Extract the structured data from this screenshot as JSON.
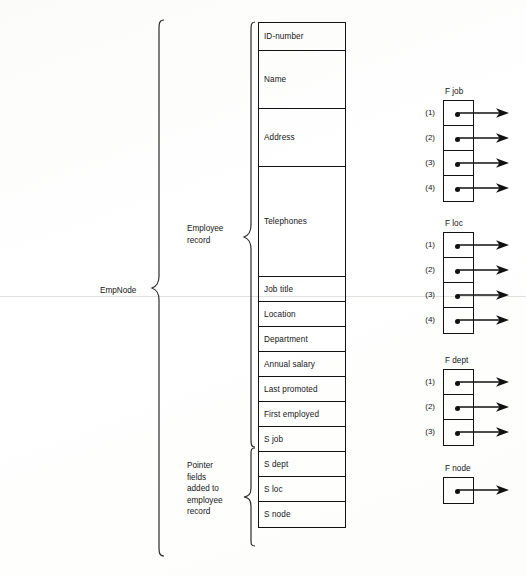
{
  "figure": {
    "node_label": "EmpNode",
    "group_labels": {
      "employee_record": "Employee\nrecord",
      "pointer_fields": "Pointer\nfields\nadded to\nemployee\nrecord"
    }
  },
  "record_fields": [
    {
      "label": "ID-number",
      "height": 28
    },
    {
      "label": "Name",
      "height": 58
    },
    {
      "label": "Address",
      "height": 58
    },
    {
      "label": "Telephones",
      "height": 110
    },
    {
      "label": "Job title",
      "height": 25
    },
    {
      "label": "Location",
      "height": 25
    },
    {
      "label": "Department",
      "height": 25
    },
    {
      "label": "Annual salary",
      "height": 25
    },
    {
      "label": "Last promoted",
      "height": 25
    },
    {
      "label": "First employed",
      "height": 25
    },
    {
      "label": "S job",
      "height": 25
    },
    {
      "label": "S dept",
      "height": 25
    },
    {
      "label": "S loc",
      "height": 25
    },
    {
      "label": "S node",
      "height": 25
    }
  ],
  "pointer_tables": [
    {
      "title": "F job",
      "top": 100,
      "rows": [
        {
          "index": "(1)"
        },
        {
          "index": "(2)"
        },
        {
          "index": "(3)"
        },
        {
          "index": "(4)"
        }
      ]
    },
    {
      "title": "F loc",
      "top": 232,
      "rows": [
        {
          "index": "(1)"
        },
        {
          "index": "(2)"
        },
        {
          "index": "(3)"
        },
        {
          "index": "(4)"
        }
      ]
    },
    {
      "title": "F dept",
      "top": 369,
      "rows": [
        {
          "index": "(1)"
        },
        {
          "index": "(2)"
        },
        {
          "index": "(3)"
        }
      ]
    },
    {
      "title": "F node",
      "top": 477,
      "rows": [
        {
          "index": ""
        }
      ]
    }
  ],
  "colors": {
    "ink": "#121212",
    "paper": "#ffffff"
  }
}
